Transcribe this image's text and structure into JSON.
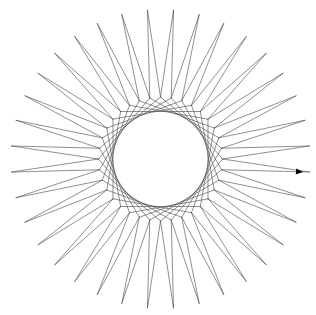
{
  "canvas": {
    "width": 316,
    "height": 315,
    "background": "#ffffff"
  },
  "drawing": {
    "type": "turtle-star-pattern",
    "center": [
      160.5,
      159
    ],
    "spike_count": 36,
    "outer_radius": 149.5,
    "inner_vertex_radius": 62,
    "inner_chord_step": 8,
    "tip_angle_offset_deg": 5,
    "stroke_color": "#444444",
    "stroke_width": 0.6
  },
  "turtle": {
    "icon": "turtle-arrow-cursor",
    "position": [
      303,
      172
    ],
    "heading_deg": 5,
    "color": "#000000"
  }
}
